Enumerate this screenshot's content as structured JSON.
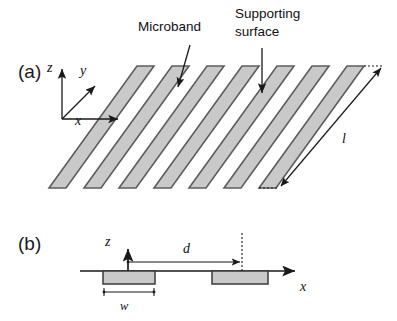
{
  "figure": {
    "panels": [
      {
        "tag": "(a)",
        "x": 18,
        "y": 78
      },
      {
        "tag": "(b)",
        "x": 18,
        "y": 250
      }
    ],
    "callouts": [
      {
        "name": "microband",
        "text": "Microband",
        "x": 138,
        "y": 31
      },
      {
        "name": "supporting-surface-line1",
        "text": "Supporting",
        "x": 235,
        "y": 18
      },
      {
        "name": "supporting-surface-line2",
        "text": "surface",
        "x": 235,
        "y": 36
      }
    ],
    "panel_a": {
      "axes": [
        {
          "name": "z",
          "label": "z",
          "lx": 47,
          "ly": 72
        },
        {
          "name": "y",
          "label": "y",
          "lx": 80,
          "ly": 75
        },
        {
          "name": "x",
          "label": "x",
          "lx": 75,
          "ly": 125
        }
      ],
      "dimension": {
        "name": "l",
        "label": "l",
        "lx": 342,
        "ly": 143
      },
      "band_count": 7
    },
    "panel_b": {
      "axes": [
        {
          "name": "z",
          "label": "z",
          "lx": 105,
          "ly": 246
        },
        {
          "name": "x",
          "label": "x",
          "lx": 300,
          "ly": 291
        }
      ],
      "dimensions": [
        {
          "name": "d",
          "label": "d",
          "lx": 183,
          "ly": 253
        },
        {
          "name": "w",
          "label": "w",
          "lx": 120,
          "ly": 305
        }
      ],
      "blocks": [
        {
          "name": "microband-block-1",
          "x": 103,
          "width": 52
        },
        {
          "name": "microband-block-2",
          "x": 212,
          "width": 56
        }
      ]
    },
    "colors": {
      "band_fill": "#c9c9c9",
      "band_stroke": "#5d5d5d",
      "line": "#1a1a1a",
      "background": "#ffffff"
    }
  }
}
